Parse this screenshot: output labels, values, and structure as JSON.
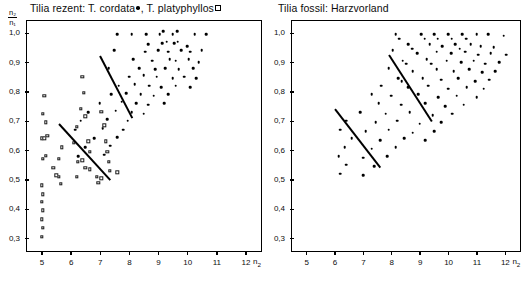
{
  "figure": {
    "background": "#ffffff",
    "ink": "#000000"
  },
  "chart_data": [
    {
      "type": "scatter",
      "panel": "left",
      "title": "Tilia rezent: T. cordata •, T. platyphyllos ▫",
      "title_parts": {
        "prefix": "Tilia rezent: T. cordata",
        "middle": ", T. platyphyllos",
        "marker_1": "filled-dot",
        "marker_2": "open-square"
      },
      "xlabel": "n₂",
      "ylabel": "n₂/n₁",
      "ylabel_numerator": "n₂",
      "ylabel_denominator": "n₁",
      "xlim": [
        4.45,
        12.55
      ],
      "ylim": [
        0.255,
        1.045
      ],
      "xticks": [
        5,
        6,
        7,
        8,
        9,
        10,
        11,
        12
      ],
      "xtick_labels": [
        "5",
        "6",
        "7",
        "8",
        "9",
        "10",
        "11",
        "12"
      ],
      "yticks": [
        0.3,
        0.4,
        0.5,
        0.6,
        0.7,
        0.8,
        0.9,
        1.0
      ],
      "ytick_labels": [
        "0,3",
        "0,4",
        "0,5",
        "0,6",
        "0,7",
        "0,8",
        "0,9",
        "1,0"
      ],
      "grid": false,
      "legend": "in-title",
      "series": [
        {
          "name": "T. cordata",
          "marker": "filled-dot",
          "points": [
            [
              7.55,
              1.0
            ],
            [
              8.05,
              1.0
            ],
            [
              8.55,
              1.0
            ],
            [
              9.0,
              1.0
            ],
            [
              9.12,
              1.01
            ],
            [
              9.45,
              1.0
            ],
            [
              9.6,
              1.01
            ],
            [
              10.2,
              1.0
            ],
            [
              10.6,
              1.0
            ],
            [
              8.6,
              0.965
            ],
            [
              9.1,
              0.97
            ],
            [
              9.25,
              0.975
            ],
            [
              9.5,
              0.97
            ],
            [
              9.62,
              0.975
            ],
            [
              9.95,
              0.96
            ],
            [
              7.45,
              0.945
            ],
            [
              8.5,
              0.94
            ],
            [
              8.95,
              0.945
            ],
            [
              9.3,
              0.94
            ],
            [
              9.75,
              0.945
            ],
            [
              10.05,
              0.94
            ],
            [
              10.45,
              0.945
            ],
            [
              8.1,
              0.915
            ],
            [
              8.75,
              0.91
            ],
            [
              9.35,
              0.915
            ],
            [
              9.55,
              0.91
            ],
            [
              10.0,
              0.915
            ],
            [
              10.35,
              0.905
            ],
            [
              7.25,
              0.885
            ],
            [
              8.3,
              0.885
            ],
            [
              8.85,
              0.88
            ],
            [
              9.2,
              0.885
            ],
            [
              9.65,
              0.88
            ],
            [
              10.15,
              0.885
            ],
            [
              7.95,
              0.855
            ],
            [
              8.45,
              0.86
            ],
            [
              8.9,
              0.855
            ],
            [
              9.45,
              0.85
            ],
            [
              9.85,
              0.855
            ],
            [
              10.25,
              0.85
            ],
            [
              7.6,
              0.825
            ],
            [
              8.15,
              0.83
            ],
            [
              8.65,
              0.825
            ],
            [
              9.05,
              0.82
            ],
            [
              9.55,
              0.825
            ],
            [
              10.05,
              0.82
            ],
            [
              7.35,
              0.795
            ],
            [
              7.85,
              0.8
            ],
            [
              8.35,
              0.795
            ],
            [
              8.8,
              0.79
            ],
            [
              9.3,
              0.795
            ],
            [
              6.95,
              0.765
            ],
            [
              7.7,
              0.77
            ],
            [
              8.2,
              0.765
            ],
            [
              8.6,
              0.76
            ],
            [
              9.15,
              0.765
            ],
            [
              6.55,
              0.735
            ],
            [
              7.5,
              0.74
            ],
            [
              8.05,
              0.735
            ],
            [
              8.45,
              0.73
            ],
            [
              6.3,
              0.705
            ],
            [
              7.2,
              0.71
            ],
            [
              7.9,
              0.705
            ],
            [
              6.1,
              0.675
            ],
            [
              7.05,
              0.68
            ],
            [
              7.75,
              0.675
            ],
            [
              6.75,
              0.645
            ],
            [
              7.55,
              0.65
            ],
            [
              6.45,
              0.615
            ],
            [
              7.3,
              0.62
            ],
            [
              6.2,
              0.585
            ],
            [
              7.1,
              0.59
            ]
          ]
        },
        {
          "name": "T. platyphyllos",
          "marker": "open-square",
          "points": [
            [
              6.35,
              0.855
            ],
            [
              6.4,
              0.8
            ],
            [
              5.05,
              0.79
            ],
            [
              6.3,
              0.745
            ],
            [
              6.45,
              0.72
            ],
            [
              5.0,
              0.73
            ],
            [
              7.0,
              0.735
            ],
            [
              5.1,
              0.7
            ],
            [
              6.15,
              0.685
            ],
            [
              7.1,
              0.69
            ],
            [
              4.95,
              0.645
            ],
            [
              5.05,
              0.645
            ],
            [
              5.15,
              0.655
            ],
            [
              6.05,
              0.63
            ],
            [
              6.55,
              0.635
            ],
            [
              7.15,
              0.635
            ],
            [
              5.65,
              0.615
            ],
            [
              6.6,
              0.6
            ],
            [
              7.2,
              0.6
            ],
            [
              5.0,
              0.575
            ],
            [
              5.1,
              0.585
            ],
            [
              5.55,
              0.575
            ],
            [
              6.2,
              0.565
            ],
            [
              6.35,
              0.57
            ],
            [
              7.25,
              0.565
            ],
            [
              5.35,
              0.545
            ],
            [
              6.45,
              0.545
            ],
            [
              6.6,
              0.54
            ],
            [
              7.3,
              0.535
            ],
            [
              7.55,
              0.53
            ],
            [
              5.45,
              0.52
            ],
            [
              5.55,
              0.515
            ],
            [
              6.15,
              0.515
            ],
            [
              6.85,
              0.515
            ],
            [
              7.0,
              0.51
            ],
            [
              4.95,
              0.485
            ],
            [
              5.0,
              0.455
            ],
            [
              4.95,
              0.43
            ],
            [
              5.0,
              0.4
            ],
            [
              4.95,
              0.37
            ],
            [
              5.0,
              0.34
            ],
            [
              4.95,
              0.31
            ],
            [
              5.6,
              0.49
            ],
            [
              6.9,
              0.495
            ]
          ]
        }
      ],
      "trend_lines": [
        {
          "name": "upper-regression",
          "x1": 6.95,
          "y1": 0.925,
          "x2": 8.05,
          "y2": 0.715
        },
        {
          "name": "lower-regression",
          "x1": 5.55,
          "y1": 0.695,
          "x2": 7.3,
          "y2": 0.505
        }
      ]
    },
    {
      "type": "scatter",
      "panel": "right",
      "title": "Tilia fossil: Harzvorland",
      "xlabel": "n₂",
      "ylabel": "n₂/n₁",
      "xlim": [
        4.45,
        12.55
      ],
      "ylim": [
        0.255,
        1.045
      ],
      "xticks": [
        5,
        6,
        7,
        8,
        9,
        10,
        11,
        12
      ],
      "xtick_labels": [
        "5",
        "6",
        "7",
        "8",
        "9",
        "10",
        "11",
        "12"
      ],
      "yticks": [
        0.3,
        0.4,
        0.5,
        0.6,
        0.7,
        0.8,
        0.9,
        1.0
      ],
      "ytick_labels": [
        "0,3",
        "0,4",
        "0,5",
        "0,6",
        "0,7",
        "0,8",
        "0,9",
        "1,0"
      ],
      "grid": false,
      "series": [
        {
          "name": "Tilia fossil",
          "marker": "filled-dot",
          "points": [
            [
              8.1,
              1.0
            ],
            [
              8.22,
              0.985
            ],
            [
              9.0,
              1.0
            ],
            [
              9.12,
              0.985
            ],
            [
              9.45,
              1.0
            ],
            [
              9.58,
              0.985
            ],
            [
              9.95,
              1.0
            ],
            [
              10.08,
              0.985
            ],
            [
              10.45,
              1.0
            ],
            [
              10.58,
              0.985
            ],
            [
              10.95,
              1.0
            ],
            [
              11.35,
              1.0
            ],
            [
              11.9,
              0.995
            ],
            [
              8.55,
              0.965
            ],
            [
              8.68,
              0.95
            ],
            [
              9.3,
              0.965
            ],
            [
              9.75,
              0.96
            ],
            [
              10.2,
              0.965
            ],
            [
              10.35,
              0.95
            ],
            [
              10.75,
              0.965
            ],
            [
              11.1,
              0.96
            ],
            [
              11.55,
              0.955
            ],
            [
              8.0,
              0.945
            ],
            [
              8.85,
              0.935
            ],
            [
              9.55,
              0.94
            ],
            [
              10.05,
              0.935
            ],
            [
              10.55,
              0.94
            ],
            [
              11.0,
              0.93
            ],
            [
              11.45,
              0.935
            ],
            [
              12.0,
              0.93
            ],
            [
              8.35,
              0.91
            ],
            [
              8.48,
              0.9
            ],
            [
              9.2,
              0.915
            ],
            [
              9.35,
              0.9
            ],
            [
              9.9,
              0.91
            ],
            [
              10.4,
              0.905
            ],
            [
              10.85,
              0.91
            ],
            [
              11.25,
              0.9
            ],
            [
              11.75,
              0.905
            ],
            [
              7.85,
              0.885
            ],
            [
              8.7,
              0.875
            ],
            [
              9.55,
              0.88
            ],
            [
              10.15,
              0.875
            ],
            [
              10.7,
              0.88
            ],
            [
              11.15,
              0.87
            ],
            [
              11.6,
              0.875
            ],
            [
              8.2,
              0.85
            ],
            [
              8.32,
              0.84
            ],
            [
              9.05,
              0.85
            ],
            [
              9.7,
              0.845
            ],
            [
              10.3,
              0.85
            ],
            [
              10.9,
              0.84
            ],
            [
              11.4,
              0.845
            ],
            [
              7.6,
              0.825
            ],
            [
              8.55,
              0.82
            ],
            [
              9.25,
              0.825
            ],
            [
              9.95,
              0.815
            ],
            [
              10.6,
              0.82
            ],
            [
              11.2,
              0.815
            ],
            [
              7.25,
              0.795
            ],
            [
              7.95,
              0.79
            ],
            [
              8.9,
              0.795
            ],
            [
              9.6,
              0.785
            ],
            [
              10.25,
              0.79
            ],
            [
              10.95,
              0.785
            ],
            [
              7.5,
              0.765
            ],
            [
              8.3,
              0.76
            ],
            [
              9.15,
              0.765
            ],
            [
              9.85,
              0.755
            ],
            [
              10.5,
              0.76
            ],
            [
              6.85,
              0.735
            ],
            [
              7.75,
              0.73
            ],
            [
              8.6,
              0.735
            ],
            [
              9.4,
              0.725
            ],
            [
              10.1,
              0.73
            ],
            [
              6.35,
              0.705
            ],
            [
              7.4,
              0.7
            ],
            [
              8.15,
              0.705
            ],
            [
              8.95,
              0.695
            ],
            [
              9.7,
              0.7
            ],
            [
              6.15,
              0.675
            ],
            [
              7.05,
              0.67
            ],
            [
              7.85,
              0.675
            ],
            [
              8.7,
              0.665
            ],
            [
              9.45,
              0.67
            ],
            [
              6.55,
              0.645
            ],
            [
              7.55,
              0.64
            ],
            [
              8.4,
              0.645
            ],
            [
              9.15,
              0.64
            ],
            [
              6.3,
              0.615
            ],
            [
              7.25,
              0.61
            ],
            [
              8.1,
              0.615
            ],
            [
              6.1,
              0.585
            ],
            [
              6.95,
              0.58
            ],
            [
              7.8,
              0.585
            ],
            [
              6.35,
              0.555
            ],
            [
              7.35,
              0.55
            ],
            [
              6.15,
              0.525
            ],
            [
              6.95,
              0.52
            ]
          ]
        }
      ],
      "trend_lines": [
        {
          "name": "upper-regression",
          "x1": 7.85,
          "y1": 0.93,
          "x2": 9.35,
          "y2": 0.705
        },
        {
          "name": "lower-regression",
          "x1": 5.95,
          "y1": 0.745,
          "x2": 7.55,
          "y2": 0.545
        }
      ]
    }
  ]
}
